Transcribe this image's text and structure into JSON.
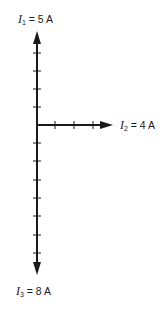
{
  "diagram": {
    "type": "phasor-current-diagram",
    "unit_tick_px": 18.6,
    "vectors": [
      {
        "name": "I1",
        "symbol": "I",
        "subscript": "1",
        "value": "5",
        "unit": "A",
        "direction": "up",
        "magnitude": 5
      },
      {
        "name": "I2",
        "symbol": "I",
        "subscript": "2",
        "value": "4",
        "unit": "A",
        "direction": "right",
        "magnitude": 4
      },
      {
        "name": "I3",
        "symbol": "I",
        "subscript": "3",
        "value": "8",
        "unit": "A",
        "direction": "down",
        "magnitude": 8
      }
    ],
    "labels": {
      "i1": {
        "symbol": "I",
        "sub": "1",
        "eq": " = 5 A"
      },
      "i2": {
        "symbol": "I",
        "sub": "2",
        "eq": " = 4 A"
      },
      "i3": {
        "symbol": "I",
        "sub": "3",
        "eq": " = 8 A"
      }
    },
    "colors": {
      "stroke": "#1a1a1a",
      "background": "#ffffff"
    }
  }
}
